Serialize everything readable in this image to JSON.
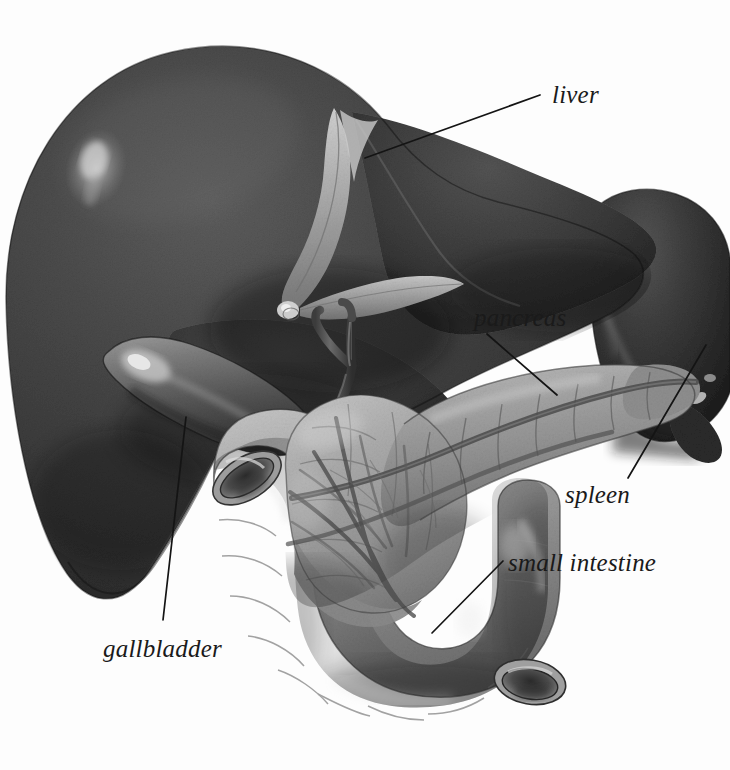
{
  "figure": {
    "type": "anatomical-illustration",
    "style": "grayscale pencil / airbrush medical illustration",
    "background_color": "#fdfdfd",
    "width": 730,
    "height": 770,
    "ink_color": "#141414"
  },
  "labels": [
    {
      "id": "liver",
      "text": "liver",
      "x": 552,
      "y": 82,
      "leader": {
        "x1": 540,
        "y1": 95,
        "x2": 365,
        "y2": 158
      },
      "organ_color": "#4a4a4a"
    },
    {
      "id": "pancreas",
      "text": "pancreas",
      "x": 474,
      "y": 305,
      "leader": {
        "x1": 487,
        "y1": 334,
        "x2": 557,
        "y2": 395
      },
      "organ_color": "#9a9a9a"
    },
    {
      "id": "spleen",
      "text": "spleen",
      "x": 565,
      "y": 482,
      "leader": {
        "x1": 628,
        "y1": 478,
        "x2": 706,
        "y2": 345
      },
      "organ_color": "#3a3a3a"
    },
    {
      "id": "small-intestine",
      "text": "small intestine",
      "x": 508,
      "y": 550,
      "leader": {
        "x1": 503,
        "y1": 561,
        "x2": 432,
        "y2": 633
      },
      "organ_color": "#a5a5a5"
    },
    {
      "id": "gallbladder",
      "text": "gallbladder",
      "x": 103,
      "y": 636,
      "leader": {
        "x1": 186,
        "y1": 417,
        "x2": 163,
        "y2": 620
      },
      "organ_color": "#6e6e6e"
    }
  ],
  "organs": [
    {
      "name": "liver",
      "description": "large dark lobed mass occupying upper-left, with specular highlight and falciform ligament"
    },
    {
      "name": "gallbladder",
      "description": "elongated pear-shaped sac tucked beneath the liver, lighter tone with a bright highlight"
    },
    {
      "name": "pancreas",
      "description": "elongated lobulated gland sweeping from lower-left to upper-right, mid-gray with surface vessels"
    },
    {
      "name": "spleen",
      "description": "dark ovoid organ at upper-right behind the pancreatic tail"
    },
    {
      "name": "small intestine",
      "description": "C-shaped duodenal loop encircling the head of the pancreas, two cut lumens visible"
    },
    {
      "name": "bile ducts",
      "description": "branching hepatic and common bile ducts descending from liver hilum into the pancreas head"
    }
  ]
}
